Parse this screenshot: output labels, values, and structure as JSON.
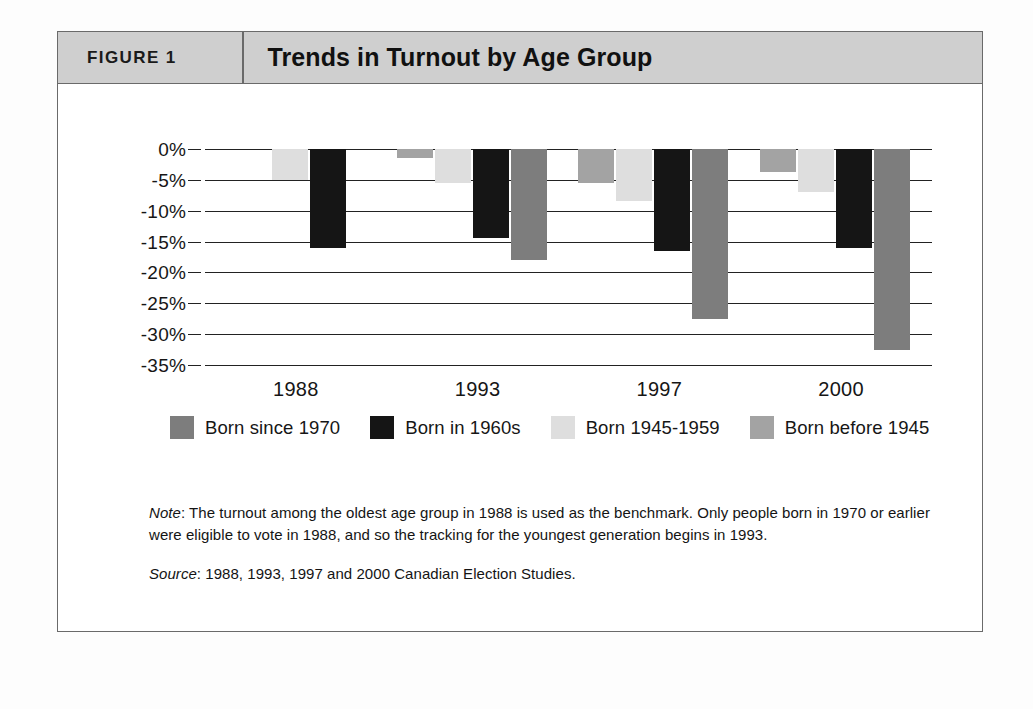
{
  "figure": {
    "number_label": "FIGURE 1",
    "title": "Trends in Turnout by Age Group"
  },
  "footnotes": {
    "note_lead": "Note",
    "note_text": ": The turnout among the oldest age group in 1988 is used as the benchmark. Only people born in 1970 or earlier were eligible to vote in 1988, and so the tracking for the youngest generation begins in 1993.",
    "source_lead": "Source",
    "source_text": ": 1988, 1993, 1997 and 2000 Canadian Election Studies."
  },
  "colors": {
    "born_since_1970": "#7d7d7d",
    "born_in_1960s": "#151515",
    "born_1945_1959": "#dedede",
    "born_before_1945": "#a3a3a3",
    "header_band": "#cfcfcf",
    "frame_border": "#6a6a6a",
    "gridline": "#222222"
  },
  "chart_data": {
    "type": "bar",
    "title": "Trends in Turnout by Age Group",
    "xlabel": "",
    "ylabel": "",
    "categories": [
      "1988",
      "1993",
      "1997",
      "2000"
    ],
    "ylim": [
      -35,
      0
    ],
    "ytick_labels": [
      "0%",
      "-5%",
      "-10%",
      "-15%",
      "-20%",
      "-25%",
      "-30%",
      "-35%"
    ],
    "ytick_values": [
      0,
      -5,
      -10,
      -15,
      -20,
      -25,
      -30,
      -35
    ],
    "grid": true,
    "legend_position": "below-plot",
    "legend_order": [
      "Born since 1970",
      "Born in 1960s",
      "Born 1945-1959",
      "Born before 1945"
    ],
    "bar_draw_order": [
      "Born before 1945",
      "Born 1945-1959",
      "Born in 1960s",
      "Born since 1970"
    ],
    "series": [
      {
        "name": "Born before 1945",
        "key": "born_before_1945",
        "color": "#a3a3a3",
        "values": [
          0.0,
          -1.5,
          -5.5,
          -3.7
        ]
      },
      {
        "name": "Born 1945-1959",
        "key": "born_1945_1959",
        "color": "#dedede",
        "values": [
          -5.0,
          -5.5,
          -8.5,
          -7.0
        ]
      },
      {
        "name": "Born in 1960s",
        "key": "born_in_1960s",
        "color": "#151515",
        "values": [
          -16.0,
          -14.5,
          -16.5,
          -16.0
        ]
      },
      {
        "name": "Born since 1970",
        "key": "born_since_1970",
        "color": "#7d7d7d",
        "values": [
          null,
          -18.0,
          -27.5,
          -32.5
        ]
      }
    ]
  }
}
